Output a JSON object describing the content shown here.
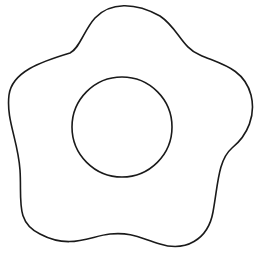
{
  "drawing": {
    "description": "Line drawing of a fried-egg / flower outline with a circular center",
    "background": "#ffffff",
    "stroke_color": "#1a1a1a",
    "stroke_width": 1.6,
    "outer_shape": {
      "type": "wavy five-lobed outline"
    },
    "inner_circle": {
      "cx": 122,
      "cy": 127,
      "r": 50
    }
  }
}
